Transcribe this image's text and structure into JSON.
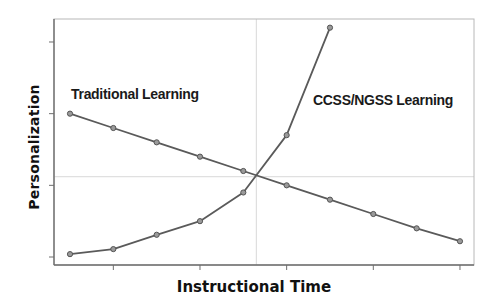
{
  "chart_data": {
    "type": "line",
    "title": "",
    "xlabel": "Instructional Time",
    "ylabel": "Personalization",
    "x": [
      1,
      2,
      3,
      4,
      5,
      6,
      7,
      8,
      9,
      10
    ],
    "xlim": [
      0.4,
      10.3
    ],
    "ylim": [
      -0.11,
      3.32
    ],
    "x_ticks": [
      2,
      4,
      6,
      8,
      10
    ],
    "y_ticks": [
      0,
      1,
      2,
      3
    ],
    "tick_labels_visible": false,
    "grid": {
      "vertical": [
        5.3
      ],
      "horizontal": [
        1.12
      ]
    },
    "legend": "none (inline series labels)",
    "series": [
      {
        "name": "Traditional Learning",
        "x": [
          1,
          2,
          3,
          4,
          5,
          6,
          7,
          8,
          9,
          10
        ],
        "values": [
          2.0,
          1.8,
          1.6,
          1.4,
          1.2,
          1.0,
          0.8,
          0.6,
          0.4,
          0.22
        ],
        "label_pos": [
          71,
          86
        ]
      },
      {
        "name": "CCSS/NGSS Learning",
        "x": [
          1,
          2,
          3,
          4,
          5,
          6,
          7
        ],
        "values": [
          0.04,
          0.11,
          0.31,
          0.5,
          0.9,
          1.7,
          3.2
        ],
        "label_pos": [
          313,
          92
        ]
      }
    ],
    "colors": {
      "line": "#5a5a5a",
      "marker": "#7a7a7a",
      "axis": "#6e6e6e",
      "grid": "#d8d8d8"
    }
  }
}
